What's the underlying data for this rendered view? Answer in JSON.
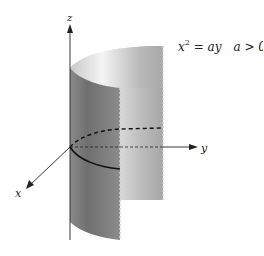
{
  "diagram": {
    "equation": {
      "lhs_var": "x",
      "exponent": "2",
      "equals": " = ",
      "rhs": "ay",
      "condition": "a > 0"
    },
    "axes": {
      "x_label": "x",
      "y_label": "y",
      "z_label": "z"
    },
    "colors": {
      "axis": "#222222",
      "surface_light": "#e6e6e6",
      "surface_mid": "#b0b0b0",
      "surface_dark": "#7c7c7c",
      "inner_surface": "#9a9a9a",
      "curve": "#111111"
    },
    "curves": {
      "base_trace": "solid parabola in xy-plane (front half)",
      "hidden_trace": "dashed parabola (back half)"
    }
  }
}
